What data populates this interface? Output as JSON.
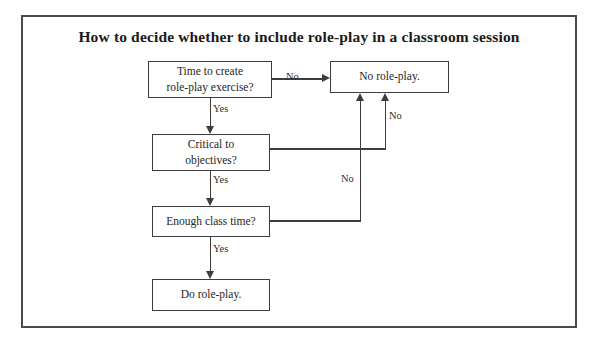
{
  "diagram": {
    "title": "How to decide whether to include role-play in a classroom session",
    "type": "flowchart",
    "frame": {
      "border_color": "#4a4a4a"
    },
    "colors": {
      "line": "#3d3d3d",
      "box_border": "#3d3d3d",
      "text": "#262626",
      "title_text": "#1a1a1a",
      "background": "#ffffff"
    },
    "nodes": [
      {
        "id": "time",
        "label": "Time to create\nrole-play exercise?",
        "shape": "rect"
      },
      {
        "id": "noplay",
        "label": "No role-play.",
        "shape": "rect"
      },
      {
        "id": "critical",
        "label": "Critical to\nobjectives?",
        "shape": "rect"
      },
      {
        "id": "enough",
        "label": "Enough class time?",
        "shape": "rect"
      },
      {
        "id": "doplay",
        "label": "Do role-play.",
        "shape": "rect"
      }
    ],
    "edges": [
      {
        "from": "time",
        "to": "noplay",
        "label": "No"
      },
      {
        "from": "time",
        "to": "critical",
        "label": "Yes"
      },
      {
        "from": "critical",
        "to": "noplay",
        "label": "No"
      },
      {
        "from": "critical",
        "to": "enough",
        "label": "Yes"
      },
      {
        "from": "enough",
        "to": "noplay",
        "label": "No"
      },
      {
        "from": "enough",
        "to": "doplay",
        "label": "Yes"
      }
    ],
    "edge_labels": {
      "time_no": "No",
      "time_yes": "Yes",
      "critical_no": "No",
      "critical_yes": "Yes",
      "enough_no": "No",
      "enough_yes": "Yes"
    }
  }
}
